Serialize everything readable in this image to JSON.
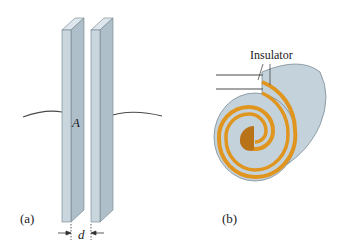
{
  "figure_a": {
    "panel_label": "(a)",
    "area_label": "A",
    "gap_label": "d",
    "colors": {
      "plate_front": "#c9d6de",
      "plate_side": "#aebfca",
      "plate_top": "#dde6ec",
      "edge": "#6f7f8a",
      "wire": "#4a4a4a"
    }
  },
  "figure_b": {
    "panel_label": "(b)",
    "callout_label": "Insulator",
    "colors": {
      "conductor": "#e0951f",
      "insulator": "#c4d2dc",
      "core": "#b87318",
      "edge": "#6f7f8a"
    }
  }
}
